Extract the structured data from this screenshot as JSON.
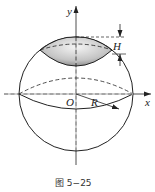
{
  "figure": {
    "caption": "图 5−25",
    "labels": {
      "y_axis": "y",
      "x_axis": "x",
      "origin": "O",
      "radius": "R",
      "height": "H"
    },
    "colors": {
      "stroke": "#222222",
      "cap_fill_light": "#f2f2f2",
      "cap_fill_dark": "#9a9a9a"
    }
  }
}
